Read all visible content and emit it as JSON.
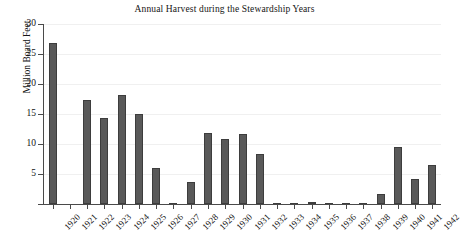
{
  "chart_data": {
    "type": "bar",
    "title": "Annual Harvest during the Stewardship Years",
    "xlabel": "",
    "ylabel": "Million Board Feet",
    "ylim": [
      0,
      30
    ],
    "yticks": [
      0,
      5,
      10,
      15,
      20,
      25,
      30
    ],
    "ytick_labels": [
      "",
      "5",
      "10",
      "15",
      "20",
      "25",
      "30"
    ],
    "grid": true,
    "legend": false,
    "bar_color": "#595959",
    "bar_edge_color": "#3d3d3d",
    "categories": [
      "1920",
      "1921",
      "1922",
      "1923",
      "1924",
      "1925",
      "1926",
      "1927",
      "1928",
      "1929",
      "1930",
      "1931",
      "1932",
      "1933",
      "1934",
      "1935",
      "1936",
      "1937",
      "1938",
      "1939",
      "1940",
      "1941",
      "1942"
    ],
    "values": [
      26.8,
      0,
      17.3,
      14.3,
      18.2,
      15.0,
      6.0,
      0.1,
      3.7,
      11.8,
      10.9,
      11.6,
      8.4,
      0.2,
      0.15,
      0.4,
      0.15,
      0.15,
      0.05,
      1.7,
      9.5,
      4.2,
      6.5
    ]
  }
}
